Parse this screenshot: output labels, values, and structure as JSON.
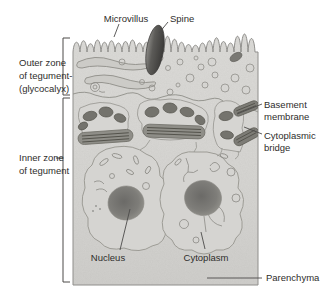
{
  "figure": {
    "type": "textbook-anatomy-diagram",
    "labels": {
      "microvillus": "Microvillus",
      "spine": "Spine",
      "outer_zone": [
        "Outer zone",
        "of tegument-",
        "(glycocalyx)"
      ],
      "basement_membrane": [
        "Basement",
        "membrane"
      ],
      "cytoplasmic_bridge": [
        "Cytoplasmic",
        "bridge"
      ],
      "inner_zone": [
        "Inner zone",
        "of tegument"
      ],
      "nucleus": "Nucleus",
      "cytoplasm": "Cytoplasm",
      "parenchyma": "Parenchyma"
    },
    "colors": {
      "background": "#ffffff",
      "tissue_fill": "#d8d7d4",
      "outline": "#8e8d8a",
      "dark_structure": "#74736d",
      "spine": "#4a4a47",
      "text": "#2e2d2b",
      "leader_line": "#4c4b49"
    }
  }
}
